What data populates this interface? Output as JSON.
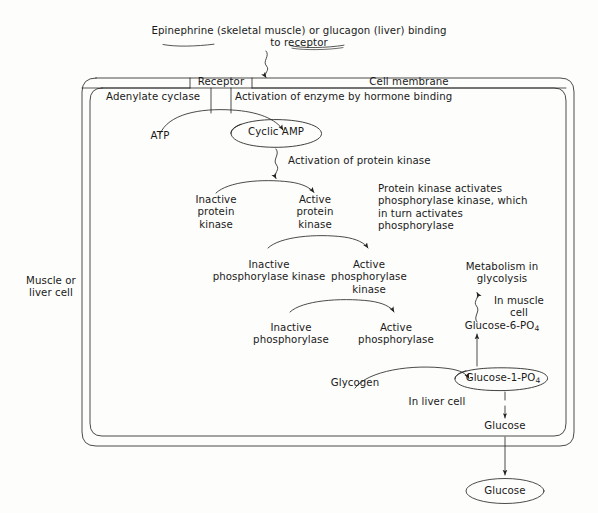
{
  "diagram": {
    "title_text": "Epinephrine (skeletal muscle) or glucagon (liver) binding to receptor",
    "outside_label": "Muscle or\nliver cell",
    "membrane": {
      "receptor_label": "Receptor",
      "cell_membrane_label": "Cell membrane",
      "adenylate_cyclase_label": "Adenylate cyclase",
      "activation_label": "Activation of enzyme by hormone binding"
    },
    "nodes": {
      "atp": "ATP",
      "cyclic_amp": "Cyclic AMP",
      "activation_protein_kinase": "Activation of protein kinase",
      "inactive_protein_kinase": "Inactive\nprotein\nkinase",
      "active_protein_kinase": "Active\nprotein\nkinase",
      "explanation": "Protein kinase activates\nphosphorylase kinase, which\nin turn activates\nphosphorylase",
      "inactive_phosphorylase_kinase": "Inactive\nphosphorylase kinase",
      "active_phosphorylase_kinase": "Active\nphosphorylase\nkinase",
      "inactive_phosphorylase": "Inactive\nphosphorylase",
      "active_phosphorylase": "Active\nphosphorylase",
      "glycogen": "Glycogen",
      "metabolism": "Metabolism in\nglycolysis",
      "in_muscle_cell": "In muscle\ncell",
      "glucose_6_po4": "Glucose-6-PO",
      "glucose_6_po4_sub": "4",
      "glucose_1_po4": "Glucose-1-PO",
      "glucose_1_po4_sub": "4",
      "in_liver_cell": "In liver cell",
      "glucose_inside": "Glucose",
      "glucose_outside": "Glucose"
    },
    "colors": {
      "ink": "#1a1a1a",
      "line": "#2b2b2b",
      "background": "#fdfdfb"
    }
  }
}
